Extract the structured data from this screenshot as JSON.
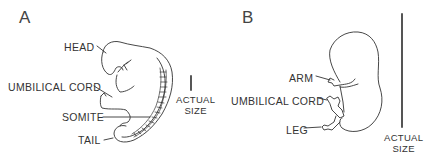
{
  "panels": [
    {
      "letter": "A",
      "labels": {
        "head": "HEAD",
        "umbilical_cord": "UMBILICAL CORD",
        "somite": "SOMITE",
        "tail": "TAIL"
      },
      "scale": {
        "line1": "ACTUAL",
        "line2": "SIZE"
      }
    },
    {
      "letter": "B",
      "labels": {
        "arm": "ARM",
        "umbilical_cord": "UMBILICAL CORD",
        "leg": "LEG"
      },
      "scale": {
        "line1": "ACTUAL",
        "line2": "SIZE"
      }
    }
  ]
}
